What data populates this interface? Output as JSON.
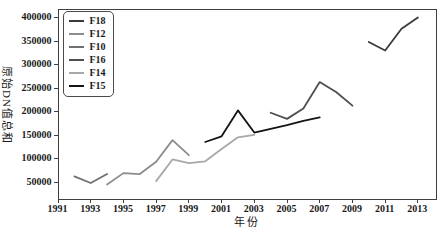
{
  "chart_data": {
    "type": "line",
    "title": "",
    "xlabel": "年份",
    "ylabel": "原始DN值总和",
    "xlim": [
      1991,
      2014.2
    ],
    "ylim": [
      13000,
      418000
    ],
    "x_ticks": [
      1991,
      1993,
      1995,
      1997,
      1999,
      2001,
      2003,
      2005,
      2007,
      2009,
      2011,
      2013
    ],
    "y_ticks": [
      50000,
      100000,
      150000,
      200000,
      250000,
      300000,
      350000,
      400000
    ],
    "grid": false,
    "legend_position": "upper-left",
    "frame_color": "#3f3f3f",
    "series": [
      {
        "name": "F18",
        "color": "#3a3a3a",
        "x": [
          2010,
          2011,
          2012,
          2013
        ],
        "values": [
          348000,
          330000,
          376000,
          400000
        ]
      },
      {
        "name": "F12",
        "color": "#8c8c8c",
        "x": [
          1994,
          1995,
          1996,
          1997,
          1998,
          1999
        ],
        "values": [
          46000,
          70000,
          68000,
          94000,
          140000,
          108000
        ]
      },
      {
        "name": "F10",
        "color": "#707070",
        "x": [
          1992,
          1993,
          1994
        ],
        "values": [
          63000,
          49000,
          68000
        ]
      },
      {
        "name": "F16",
        "color": "#4f4f4f",
        "x": [
          2004,
          2005,
          2006,
          2007,
          2008,
          2009
        ],
        "values": [
          198000,
          185000,
          207000,
          263000,
          242000,
          213000
        ]
      },
      {
        "name": "F14",
        "color": "#a8a8a8",
        "x": [
          1997,
          1998,
          1999,
          2000,
          2001,
          2002,
          2003
        ],
        "values": [
          53000,
          99000,
          91000,
          95000,
          121000,
          146000,
          151000
        ]
      },
      {
        "name": "F15",
        "color": "#141414",
        "x": [
          2000,
          2001,
          2002,
          2003,
          2004,
          2005,
          2006,
          2007
        ],
        "values": [
          136000,
          148000,
          203000,
          156000,
          164000,
          172000,
          181000,
          188000
        ]
      }
    ]
  }
}
